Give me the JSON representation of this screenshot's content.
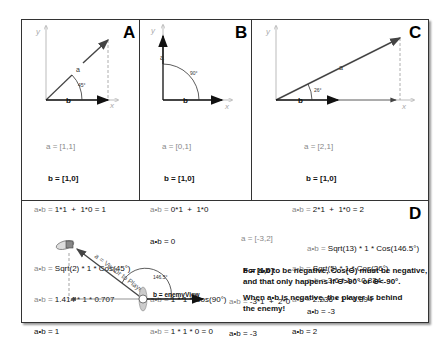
{
  "panels": {
    "A": {
      "label": "A",
      "angle": "45°",
      "vector_a_label": "a",
      "vector_b_label": "b",
      "axis_y": "y",
      "axis_x": "x",
      "lines": {
        "a_eq": "a = [1,1]",
        "b_eq": "b = [1,0]",
        "dot1_prefix": "a•b = ",
        "dot1_val": "1*1  +  1*0 = 1",
        "dot2_prefix": "a•b = ",
        "dot2_val": "Sqrt(2) * 1 * Cos(45°)",
        "dot3_prefix": "a•b = ",
        "dot3_val": "1.414 * 1 * 0.707",
        "dot4": "a•b = 1"
      }
    },
    "B": {
      "label": "B",
      "angle": "90°",
      "vector_a_label": "a",
      "vector_b_label": "b",
      "axis_y": "y",
      "axis_x": "x",
      "lines": {
        "a_eq": "a = [0,1]",
        "b_eq": "b = [1,0]",
        "dot1_prefix": "a•b = ",
        "dot1_val": "0*1  +  1*0",
        "dot2": "a•b = 0",
        "dot3_prefix": "a•b = ",
        "dot3_val": "1 * 1 * Cos(90°)",
        "dot4_prefix": "a•b = ",
        "dot4_val": "1 * 1 * 0 = 0"
      }
    },
    "C": {
      "label": "C",
      "angle": "26°",
      "vector_a_label": "a",
      "vector_b_label": "b",
      "axis_y": "y",
      "axis_x": "x",
      "lines": {
        "a_eq": "a = [2,1]",
        "b_eq": "b = [1,0]",
        "dot1_prefix": "a•b = ",
        "dot1_val": "2*1  +  1*0 = 2",
        "dot2_prefix": "a•b = ",
        "dot2_val": "Sqrt(5) * 1 * Cos(26°)",
        "dot3_prefix": "a•b = ",
        "dot3_val": "2.236 * 1 * 0.894",
        "dot4": "a•b = 2"
      }
    },
    "D": {
      "label": "D",
      "angle": "146.5°",
      "vector_a_label": "a = Vector to Player",
      "vector_b_label": "b = enemyView",
      "lines": {
        "a_eq": "a = [-3,2]",
        "b_eq": "b = [1,0]",
        "dot1_prefix": "a•b = ",
        "dot1_val": "-3*1  +  2*0",
        "dot2": "a•b = -3",
        "dot3_prefix": "a•b = ",
        "dot3_val": "Sqrt(13) * 1 * Cos(146.5°)",
        "dot4_prefix": "a•b = ",
        "dot4_val": "3.6 * 1 * -0.834",
        "dot5": "a•b = -3"
      },
      "note1": "For a•b to be negative, Cos(Θ) must be negative,\nand that only happens if Θ>90° or Θ<-90°.",
      "note2": "When a•b is negative, the player is behind\nthe enemy!"
    }
  }
}
